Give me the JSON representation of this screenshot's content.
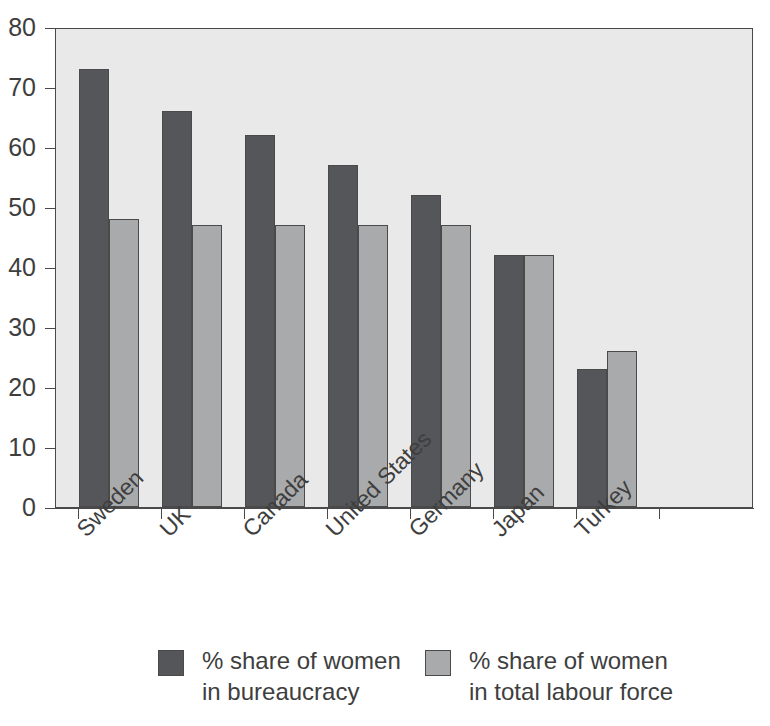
{
  "chart_data": {
    "type": "bar",
    "title": "",
    "subtitle": "",
    "xlabel": "",
    "ylabel": "",
    "ylim": [
      0,
      80
    ],
    "yticks": [
      0,
      10,
      20,
      30,
      40,
      50,
      60,
      70,
      80
    ],
    "ytick_labels": [
      "0",
      "10",
      "20",
      "30",
      "40",
      "50",
      "60",
      "70",
      "80"
    ],
    "grid": false,
    "legend_position": "bottom",
    "categories": [
      "Sweden",
      "UK",
      "Canada",
      "United States",
      "Germany",
      "Japan",
      "Turkey"
    ],
    "series": [
      {
        "name": "% share of women in bureaucracy",
        "name_lines": [
          "% share of women",
          "in bureaucracy"
        ],
        "color": "#55565a",
        "values": [
          73,
          66,
          62,
          57,
          52,
          42,
          23
        ]
      },
      {
        "name": "% share of women in total labour force",
        "name_lines": [
          "% share of women",
          "in total labour force"
        ],
        "color": "#a9aaac",
        "values": [
          48,
          47,
          47,
          47,
          47,
          42,
          26
        ]
      }
    ],
    "plot_background": "#e9e9e9",
    "axis_color": "#4a4a4a"
  }
}
